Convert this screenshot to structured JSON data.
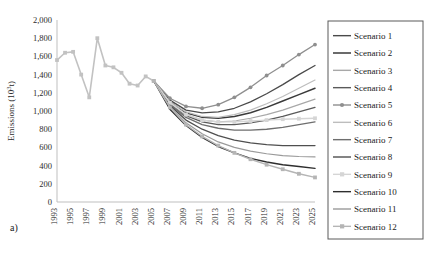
{
  "figure": {
    "panel_label": "a)"
  },
  "chart_data": {
    "type": "line",
    "title": "",
    "xlabel": "",
    "ylabel": "Emissions (10³t)",
    "ylim": [
      0,
      2000
    ],
    "ytick_labels": [
      "0",
      "200",
      "400",
      "600",
      "800",
      "1,000",
      "1,200",
      "1,400",
      "1,600",
      "1,800",
      "2,000"
    ],
    "ytick_values": [
      0,
      200,
      400,
      600,
      800,
      1000,
      1200,
      1400,
      1600,
      1800,
      2000
    ],
    "xlim": [
      1993,
      2025
    ],
    "xtick_labels": [
      "1993",
      "1995",
      "1997",
      "1999",
      "2001",
      "2003",
      "2005",
      "2007",
      "2009",
      "2011",
      "2013",
      "2015",
      "2017",
      "2019",
      "2021",
      "2023",
      "2025"
    ],
    "xtick_values": [
      1993,
      1995,
      1997,
      1999,
      2001,
      2003,
      2005,
      2007,
      2009,
      2011,
      2013,
      2015,
      2017,
      2019,
      2021,
      2023,
      2025
    ],
    "grid": false,
    "legend_position": "right",
    "x_history": [
      1993,
      1994,
      1995,
      1996,
      1997,
      1998,
      1999,
      2000,
      2001,
      2002,
      2003,
      2004,
      2005
    ],
    "history": {
      "name": "Historical",
      "color": "#c2c2c2",
      "width": 1.6,
      "marker": "square",
      "values": [
        1560,
        1640,
        1650,
        1400,
        1150,
        1800,
        1500,
        1480,
        1420,
        1300,
        1280,
        1380,
        1330
      ]
    },
    "x_forecast": [
      2005,
      2007,
      2009,
      2011,
      2013,
      2015,
      2017,
      2019,
      2021,
      2023,
      2025
    ],
    "series": [
      {
        "name": "Scenario 1",
        "color": "#4a4a4a",
        "width": 1.3,
        "marker": "none",
        "values": [
          1330,
          1120,
          1010,
          980,
          990,
          1030,
          1100,
          1190,
          1290,
          1400,
          1500
        ]
      },
      {
        "name": "Scenario 2",
        "color": "#3a3a3a",
        "width": 1.5,
        "marker": "none",
        "values": [
          1330,
          1100,
          980,
          930,
          920,
          940,
          980,
          1040,
          1110,
          1180,
          1250
        ]
      },
      {
        "name": "Scenario 3",
        "color": "#a8a8a8",
        "width": 1.2,
        "marker": "none",
        "values": [
          1330,
          1090,
          960,
          900,
          880,
          890,
          920,
          960,
          1010,
          1070,
          1130
        ]
      },
      {
        "name": "Scenario 4",
        "color": "#5a5a5a",
        "width": 1.3,
        "marker": "none",
        "values": [
          1330,
          1080,
          950,
          880,
          850,
          850,
          870,
          900,
          940,
          990,
          1040
        ]
      },
      {
        "name": "Scenario 5",
        "color": "#8f8f8f",
        "width": 1.3,
        "marker": "circle",
        "values": [
          1330,
          1140,
          1050,
          1030,
          1070,
          1150,
          1260,
          1390,
          1500,
          1620,
          1730
        ]
      },
      {
        "name": "Scenario 6",
        "color": "#bdbdbd",
        "width": 1.2,
        "marker": "none",
        "values": [
          1330,
          1100,
          990,
          940,
          930,
          960,
          1010,
          1080,
          1160,
          1250,
          1340
        ]
      },
      {
        "name": "Scenario 7",
        "color": "#6e6e6e",
        "width": 1.4,
        "marker": "none",
        "values": [
          1330,
          1070,
          930,
          850,
          810,
          790,
          790,
          800,
          820,
          850,
          880
        ]
      },
      {
        "name": "Scenario 8",
        "color": "#4f4f4f",
        "width": 1.3,
        "marker": "none",
        "values": [
          1330,
          1060,
          900,
          800,
          730,
          680,
          650,
          630,
          620,
          620,
          620
        ]
      },
      {
        "name": "Scenario 9",
        "color": "#d5d5d5",
        "width": 1.4,
        "marker": "square",
        "values": [
          1330,
          1090,
          960,
          900,
          880,
          880,
          890,
          900,
          910,
          915,
          920
        ]
      },
      {
        "name": "Scenario 10",
        "color": "#2e2e2e",
        "width": 1.4,
        "marker": "none",
        "values": [
          1330,
          1020,
          840,
          710,
          610,
          540,
          480,
          440,
          410,
          390,
          370
        ]
      },
      {
        "name": "Scenario 11",
        "color": "#9a9a9a",
        "width": 1.2,
        "marker": "none",
        "values": [
          1330,
          1050,
          870,
          750,
          660,
          600,
          560,
          530,
          510,
          500,
          495
        ]
      },
      {
        "name": "Scenario 12",
        "color": "#b5b5b5",
        "width": 1.4,
        "marker": "square",
        "values": [
          1330,
          1040,
          850,
          720,
          620,
          540,
          470,
          410,
          360,
          310,
          270
        ]
      }
    ]
  }
}
